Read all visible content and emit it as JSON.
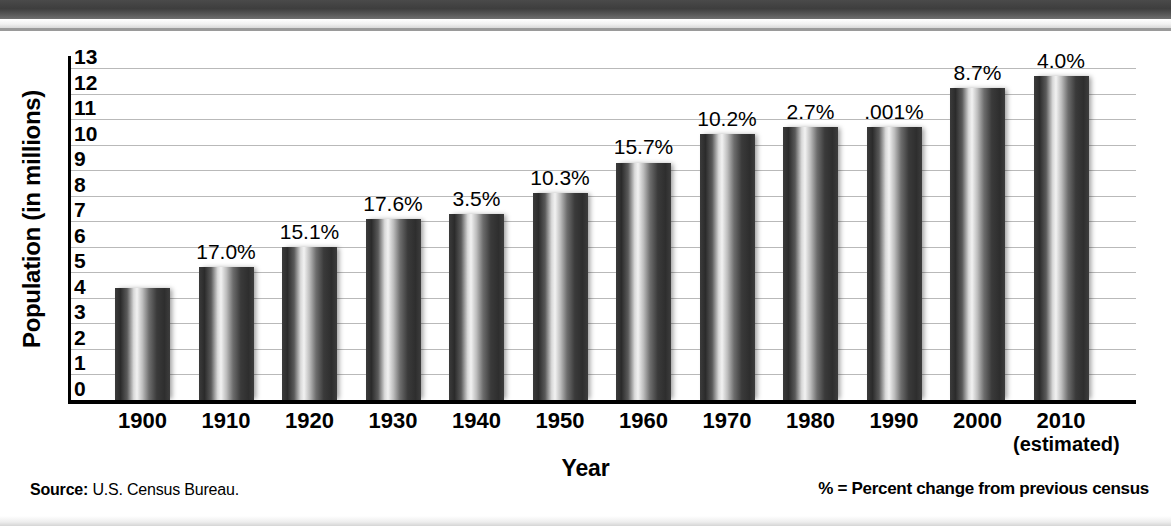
{
  "chart_data": {
    "type": "bar",
    "title": "",
    "xlabel": "Year",
    "ylabel": "Population (in millions)",
    "ylim": [
      0,
      13
    ],
    "yticks": [
      0,
      1,
      2,
      3,
      4,
      5,
      6,
      7,
      8,
      9,
      10,
      11,
      12,
      13
    ],
    "ytick_labels": [
      "0",
      "1",
      "2",
      "3",
      "4",
      "5",
      "6",
      "7",
      "8",
      "9",
      "10",
      "11",
      "12",
      "13"
    ],
    "grid": true,
    "legend": "none",
    "categories": [
      "1900",
      "1910",
      "1920",
      "1930",
      "1940",
      "1950",
      "1960",
      "1970",
      "1980",
      "1990",
      "2000",
      "2010"
    ],
    "category_sublabels": [
      "",
      "",
      "",
      "",
      "",
      "",
      "",
      "",
      "",
      "",
      "",
      "(estimated)"
    ],
    "values": [
      4.4,
      5.2,
      6.0,
      7.1,
      7.3,
      8.1,
      9.3,
      10.4,
      10.7,
      10.7,
      12.2,
      12.7
    ],
    "annotations": [
      "",
      "17.0%",
      "15.1%",
      "17.6%",
      "3.5%",
      "10.3%",
      "15.7%",
      "10.2%",
      "2.7%",
      ".001%",
      "8.7%",
      "4.0%"
    ],
    "annotation_note": "% = Percent change from previous census",
    "source": "U.S. Census Bureau."
  },
  "axis": {
    "y_title": "Population (in millions)",
    "x_title": "Year"
  },
  "footer": {
    "source_lead": "Source:",
    "source_text": "U.S. Census Bureau.",
    "legend_text": "% = Percent change from previous census"
  }
}
